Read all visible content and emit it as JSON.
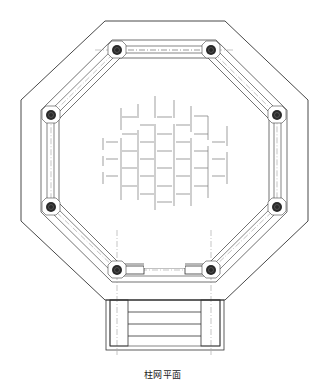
{
  "caption": "柱网平面",
  "colors": {
    "line": "#333333",
    "thin_line": "#555555",
    "grid_line": "#888888",
    "column_fill": "#2a2a2a",
    "background": "#ffffff"
  },
  "plan": {
    "shape": "octagon",
    "column_count": 8,
    "has_entrance_steps": true,
    "entrance_side": "bottom",
    "step_treads": 4,
    "center_pattern": "staggered paving grid"
  }
}
